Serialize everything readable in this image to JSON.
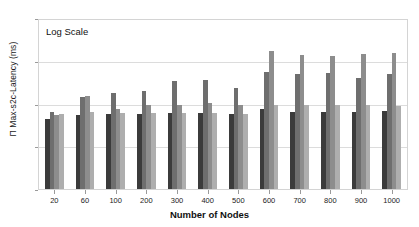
{
  "chart_data": {
    "type": "bar",
    "title": "",
    "xlabel": "Number of Nodes",
    "ylabel": "Π Max-s2c-Latency (ms)",
    "annotation": "Log Scale",
    "yscale": "log",
    "ylim": [
      1,
      10000
    ],
    "yticks": [
      1,
      10,
      100,
      1000,
      10000
    ],
    "ytick_labels": [
      "1",
      "10",
      "100",
      "1000",
      "10000"
    ],
    "grid": true,
    "legend_position": "top (cropped)",
    "categories": [
      "20",
      "60",
      "100",
      "200",
      "300",
      "400",
      "500",
      "600",
      "700",
      "800",
      "900",
      "1000"
    ],
    "series": [
      {
        "name": "series-1",
        "color": "#3b3b3b",
        "values": [
          45,
          55,
          60,
          60,
          62,
          62,
          60,
          80,
          65,
          65,
          68,
          70
        ]
      },
      {
        "name": "series-2",
        "color": "#6e6e6e",
        "values": [
          65,
          150,
          190,
          210,
          360,
          380,
          250,
          600,
          520,
          560,
          430,
          520
        ]
      },
      {
        "name": "series-3",
        "color": "#8d8d8d",
        "values": [
          58,
          160,
          80,
          95,
          100,
          110,
          95,
          1800,
          1500,
          1400,
          1600,
          1700
        ]
      },
      {
        "name": "series-4",
        "color": "#aeaeae",
        "values": [
          60,
          65,
          62,
          64,
          62,
          62,
          60,
          95,
          100,
          95,
          100,
          90
        ]
      }
    ]
  },
  "legend_strip": {
    "entries": [
      {
        "label": ""
      },
      {
        "label": ""
      },
      {
        "label": ""
      },
      {
        "label": ""
      },
      {
        "label": ""
      },
      {
        "label": ""
      },
      {
        "label": ""
      },
      {
        "label": ""
      }
    ]
  }
}
